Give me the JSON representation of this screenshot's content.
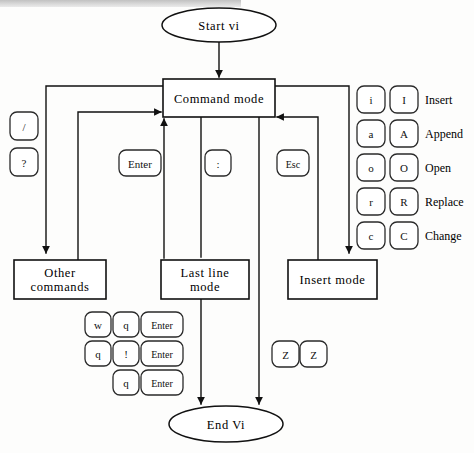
{
  "diagram": {
    "stroke_color": "#111111",
    "background_color": "#fdfdfc",
    "nodes": {
      "start": {
        "label": "Start  vi",
        "shape": "ellipse"
      },
      "command_mode": {
        "label": "Command   mode",
        "shape": "rect"
      },
      "other_commands_line1": {
        "label": "Other",
        "shape": "rect"
      },
      "other_commands_line2": {
        "label": "commands",
        "shape": "rect"
      },
      "last_line_mode_line1": {
        "label": "Last   line",
        "shape": "rect"
      },
      "last_line_mode_line2": {
        "label": "mode",
        "shape": "rect"
      },
      "insert_mode": {
        "label": "Insert   mode",
        "shape": "rect"
      },
      "end": {
        "label": "End   Vi",
        "shape": "ellipse"
      }
    },
    "search_keys": [
      {
        "label": "/"
      },
      {
        "label": "?"
      }
    ],
    "transition_keys": [
      {
        "label": "Enter",
        "name": "enter-key-to-command"
      },
      {
        "label": ":",
        "name": "colon-key"
      },
      {
        "label": "Esc",
        "name": "esc-key"
      }
    ],
    "quit_sequences": [
      {
        "keys": [
          "w",
          "q",
          "Enter"
        ]
      },
      {
        "keys": [
          "q",
          "!",
          "Enter"
        ]
      },
      {
        "keys": [
          "q",
          "Enter"
        ]
      }
    ],
    "zz_sequence": {
      "keys": [
        "Z",
        "Z"
      ]
    },
    "insert_legend": [
      {
        "lower": "i",
        "upper": "I",
        "action": "Insert"
      },
      {
        "lower": "a",
        "upper": "A",
        "action": "Append"
      },
      {
        "lower": "o",
        "upper": "O",
        "action": "Open"
      },
      {
        "lower": "r",
        "upper": "R",
        "action": "Replace"
      },
      {
        "lower": "c",
        "upper": "C",
        "action": "Change"
      }
    ]
  }
}
